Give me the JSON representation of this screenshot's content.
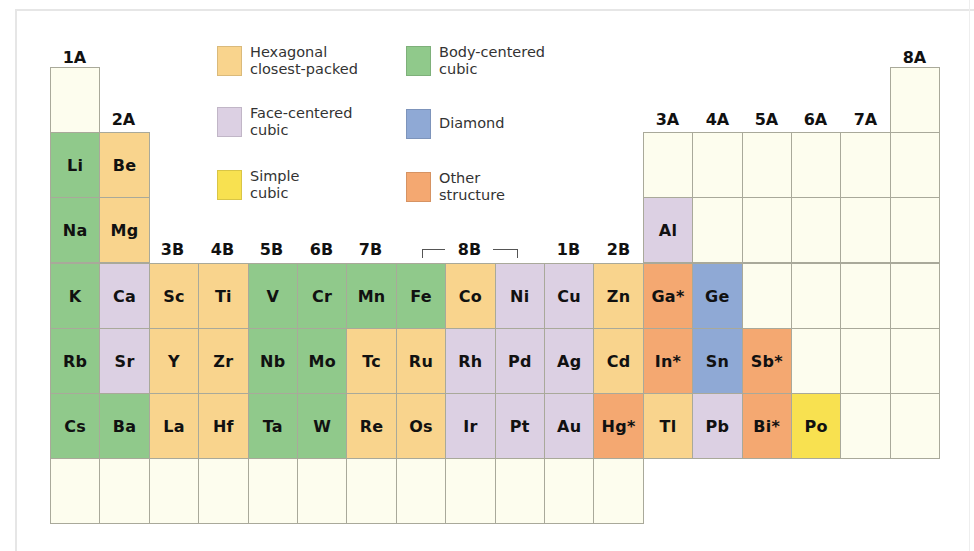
{
  "colors": {
    "hcp": "#f9d48d",
    "fcc": "#dcd0e3",
    "simple": "#f8e150",
    "bcc": "#90c98b",
    "diamond": "#8fa9d5",
    "other": "#f4a871",
    "empty": "#fdfdee"
  },
  "legend": [
    {
      "key": "hcp",
      "label": "Hexagonal\nclosest-packed"
    },
    {
      "key": "fcc",
      "label": "Face-centered\ncubic"
    },
    {
      "key": "simple",
      "label": "Simple\ncubic"
    },
    {
      "key": "bcc",
      "label": "Body-centered\ncubic"
    },
    {
      "key": "diamond",
      "label": "Diamond"
    },
    {
      "key": "other",
      "label": "Other\nstructure"
    }
  ],
  "group_labels": {
    "g1": "1A",
    "g2": "2A",
    "g3": "3B",
    "g4": "4B",
    "g5": "5B",
    "g6": "6B",
    "g7": "7B",
    "g8": "8B",
    "g11": "1B",
    "g12": "2B",
    "g13": "3A",
    "g14": "4A",
    "g15": "5A",
    "g16": "6A",
    "g17": "7A",
    "g18": "8A"
  },
  "elements": [
    {
      "period": 1,
      "group": 1,
      "symbol": "",
      "type": "empty"
    },
    {
      "period": 1,
      "group": 18,
      "symbol": "",
      "type": "empty"
    },
    {
      "period": 2,
      "group": 1,
      "symbol": "Li",
      "type": "bcc"
    },
    {
      "period": 2,
      "group": 2,
      "symbol": "Be",
      "type": "hcp"
    },
    {
      "period": 2,
      "group": 13,
      "symbol": "",
      "type": "empty"
    },
    {
      "period": 2,
      "group": 14,
      "symbol": "",
      "type": "empty"
    },
    {
      "period": 2,
      "group": 15,
      "symbol": "",
      "type": "empty"
    },
    {
      "period": 2,
      "group": 16,
      "symbol": "",
      "type": "empty"
    },
    {
      "period": 2,
      "group": 17,
      "symbol": "",
      "type": "empty"
    },
    {
      "period": 2,
      "group": 18,
      "symbol": "",
      "type": "empty"
    },
    {
      "period": 3,
      "group": 1,
      "symbol": "Na",
      "type": "bcc"
    },
    {
      "period": 3,
      "group": 2,
      "symbol": "Mg",
      "type": "hcp"
    },
    {
      "period": 3,
      "group": 13,
      "symbol": "Al",
      "type": "fcc"
    },
    {
      "period": 3,
      "group": 14,
      "symbol": "",
      "type": "empty"
    },
    {
      "period": 3,
      "group": 15,
      "symbol": "",
      "type": "empty"
    },
    {
      "period": 3,
      "group": 16,
      "symbol": "",
      "type": "empty"
    },
    {
      "period": 3,
      "group": 17,
      "symbol": "",
      "type": "empty"
    },
    {
      "period": 3,
      "group": 18,
      "symbol": "",
      "type": "empty"
    },
    {
      "period": 4,
      "group": 1,
      "symbol": "K",
      "type": "bcc"
    },
    {
      "period": 4,
      "group": 2,
      "symbol": "Ca",
      "type": "fcc"
    },
    {
      "period": 4,
      "group": 3,
      "symbol": "Sc",
      "type": "hcp"
    },
    {
      "period": 4,
      "group": 4,
      "symbol": "Ti",
      "type": "hcp"
    },
    {
      "period": 4,
      "group": 5,
      "symbol": "V",
      "type": "bcc"
    },
    {
      "period": 4,
      "group": 6,
      "symbol": "Cr",
      "type": "bcc"
    },
    {
      "period": 4,
      "group": 7,
      "symbol": "Mn",
      "type": "bcc"
    },
    {
      "period": 4,
      "group": 8,
      "symbol": "Fe",
      "type": "bcc"
    },
    {
      "period": 4,
      "group": 9,
      "symbol": "Co",
      "type": "hcp"
    },
    {
      "period": 4,
      "group": 10,
      "symbol": "Ni",
      "type": "fcc"
    },
    {
      "period": 4,
      "group": 11,
      "symbol": "Cu",
      "type": "fcc"
    },
    {
      "period": 4,
      "group": 12,
      "symbol": "Zn",
      "type": "hcp"
    },
    {
      "period": 4,
      "group": 13,
      "symbol": "Ga*",
      "type": "other"
    },
    {
      "period": 4,
      "group": 14,
      "symbol": "Ge",
      "type": "diamond"
    },
    {
      "period": 4,
      "group": 15,
      "symbol": "",
      "type": "empty"
    },
    {
      "period": 4,
      "group": 16,
      "symbol": "",
      "type": "empty"
    },
    {
      "period": 4,
      "group": 17,
      "symbol": "",
      "type": "empty"
    },
    {
      "period": 4,
      "group": 18,
      "symbol": "",
      "type": "empty"
    },
    {
      "period": 5,
      "group": 1,
      "symbol": "Rb",
      "type": "bcc"
    },
    {
      "period": 5,
      "group": 2,
      "symbol": "Sr",
      "type": "fcc"
    },
    {
      "period": 5,
      "group": 3,
      "symbol": "Y",
      "type": "hcp"
    },
    {
      "period": 5,
      "group": 4,
      "symbol": "Zr",
      "type": "hcp"
    },
    {
      "period": 5,
      "group": 5,
      "symbol": "Nb",
      "type": "bcc"
    },
    {
      "period": 5,
      "group": 6,
      "symbol": "Mo",
      "type": "bcc"
    },
    {
      "period": 5,
      "group": 7,
      "symbol": "Tc",
      "type": "hcp"
    },
    {
      "period": 5,
      "group": 8,
      "symbol": "Ru",
      "type": "hcp"
    },
    {
      "period": 5,
      "group": 9,
      "symbol": "Rh",
      "type": "fcc"
    },
    {
      "period": 5,
      "group": 10,
      "symbol": "Pd",
      "type": "fcc"
    },
    {
      "period": 5,
      "group": 11,
      "symbol": "Ag",
      "type": "fcc"
    },
    {
      "period": 5,
      "group": 12,
      "symbol": "Cd",
      "type": "hcp"
    },
    {
      "period": 5,
      "group": 13,
      "symbol": "In*",
      "type": "other"
    },
    {
      "period": 5,
      "group": 14,
      "symbol": "Sn",
      "type": "diamond"
    },
    {
      "period": 5,
      "group": 15,
      "symbol": "Sb*",
      "type": "other"
    },
    {
      "period": 5,
      "group": 16,
      "symbol": "",
      "type": "empty"
    },
    {
      "period": 5,
      "group": 17,
      "symbol": "",
      "type": "empty"
    },
    {
      "period": 5,
      "group": 18,
      "symbol": "",
      "type": "empty"
    },
    {
      "period": 6,
      "group": 1,
      "symbol": "Cs",
      "type": "bcc"
    },
    {
      "period": 6,
      "group": 2,
      "symbol": "Ba",
      "type": "bcc"
    },
    {
      "period": 6,
      "group": 3,
      "symbol": "La",
      "type": "hcp"
    },
    {
      "period": 6,
      "group": 4,
      "symbol": "Hf",
      "type": "hcp"
    },
    {
      "period": 6,
      "group": 5,
      "symbol": "Ta",
      "type": "bcc"
    },
    {
      "period": 6,
      "group": 6,
      "symbol": "W",
      "type": "bcc"
    },
    {
      "period": 6,
      "group": 7,
      "symbol": "Re",
      "type": "hcp"
    },
    {
      "period": 6,
      "group": 8,
      "symbol": "Os",
      "type": "hcp"
    },
    {
      "period": 6,
      "group": 9,
      "symbol": "Ir",
      "type": "fcc"
    },
    {
      "period": 6,
      "group": 10,
      "symbol": "Pt",
      "type": "fcc"
    },
    {
      "period": 6,
      "group": 11,
      "symbol": "Au",
      "type": "fcc"
    },
    {
      "period": 6,
      "group": 12,
      "symbol": "Hg*",
      "type": "other"
    },
    {
      "period": 6,
      "group": 13,
      "symbol": "Tl",
      "type": "hcp"
    },
    {
      "period": 6,
      "group": 14,
      "symbol": "Pb",
      "type": "fcc"
    },
    {
      "period": 6,
      "group": 15,
      "symbol": "Bi*",
      "type": "other"
    },
    {
      "period": 6,
      "group": 16,
      "symbol": "Po",
      "type": "simple"
    },
    {
      "period": 6,
      "group": 17,
      "symbol": "",
      "type": "empty"
    },
    {
      "period": 6,
      "group": 18,
      "symbol": "",
      "type": "empty"
    },
    {
      "period": 7,
      "group": 1,
      "symbol": "",
      "type": "empty"
    },
    {
      "period": 7,
      "group": 2,
      "symbol": "",
      "type": "empty"
    },
    {
      "period": 7,
      "group": 3,
      "symbol": "",
      "type": "empty"
    },
    {
      "period": 7,
      "group": 4,
      "symbol": "",
      "type": "empty"
    },
    {
      "period": 7,
      "group": 5,
      "symbol": "",
      "type": "empty"
    },
    {
      "period": 7,
      "group": 6,
      "symbol": "",
      "type": "empty"
    },
    {
      "period": 7,
      "group": 7,
      "symbol": "",
      "type": "empty"
    },
    {
      "period": 7,
      "group": 8,
      "symbol": "",
      "type": "empty"
    },
    {
      "period": 7,
      "group": 9,
      "symbol": "",
      "type": "empty"
    },
    {
      "period": 7,
      "group": 10,
      "symbol": "",
      "type": "empty"
    },
    {
      "period": 7,
      "group": 11,
      "symbol": "",
      "type": "empty"
    },
    {
      "period": 7,
      "group": 12,
      "symbol": "",
      "type": "empty"
    }
  ]
}
